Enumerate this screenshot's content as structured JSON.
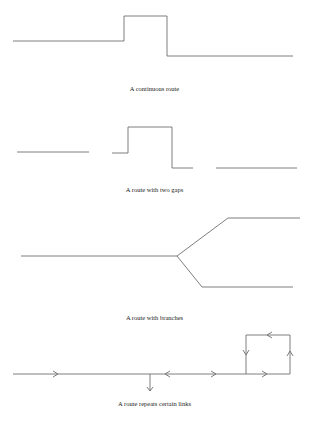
{
  "diagrams": [
    {
      "id": "continuous",
      "caption": "A continuous route"
    },
    {
      "id": "two-gaps",
      "caption": "A route with two gaps"
    },
    {
      "id": "branches",
      "caption": "A route with branches"
    },
    {
      "id": "repeats",
      "caption": "A route repeats certain links"
    }
  ],
  "colors": {
    "line": "#6f6f6f",
    "text": "#222222",
    "background": "#ffffff"
  }
}
